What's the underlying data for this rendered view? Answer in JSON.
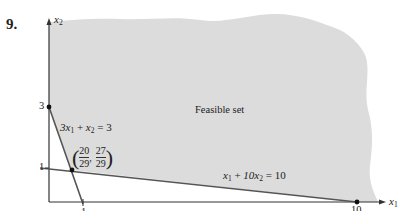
{
  "problem_number": "9.",
  "axes": {
    "x_label": "x",
    "x_sub": "1",
    "y_label": "x",
    "y_sub": "2"
  },
  "ticks": {
    "y_3": "3",
    "y_1": "1",
    "x_1": "1",
    "x_10": "10"
  },
  "region_label": "Feasible set",
  "constraints": [
    {
      "lhs_a": "3x",
      "lhs_a_sub": "1",
      "op": " + ",
      "lhs_b": "x",
      "lhs_b_sub": "2",
      "rhs": " = 3"
    },
    {
      "lhs_a": "x",
      "lhs_a_sub": "1",
      "op": " + ",
      "lhs_b": "10x",
      "lhs_b_sub": "2",
      "rhs": " = 10"
    }
  ],
  "intersection": {
    "x_num": "20",
    "x_den": "29",
    "y_num": "27",
    "y_den": "29",
    "sep": ","
  },
  "colors": {
    "feasible_fill": "#dcdcdc",
    "line": "#555555",
    "axis": "#333333"
  }
}
